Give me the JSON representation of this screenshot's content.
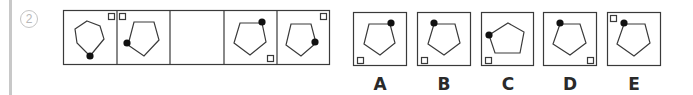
{
  "question": {
    "number": "2"
  },
  "sequence": {
    "cells": [
      {
        "id": "cell-1",
        "pentagon": "point-up",
        "dot_vertex": "bottom",
        "square_corner": "top-right"
      },
      {
        "id": "cell-2",
        "pentagon": "point-up",
        "dot_vertex": "left",
        "square_corner": "top-left"
      },
      {
        "id": "cell-3",
        "pentagon": "none",
        "dot_vertex": "none",
        "square_corner": "none",
        "blank": true
      },
      {
        "id": "cell-4",
        "pentagon": "point-up",
        "dot_vertex": "top-right",
        "square_corner": "bottom-right"
      },
      {
        "id": "cell-5",
        "pentagon": "point-up",
        "dot_vertex": "right",
        "square_corner": "top-right"
      }
    ]
  },
  "options": [
    {
      "label": "A",
      "pentagon": "point-up",
      "dot_vertex": "top-right",
      "square_corner": "bottom-left"
    },
    {
      "label": "B",
      "pentagon": "point-up",
      "dot_vertex": "top-left",
      "square_corner": "bottom-left"
    },
    {
      "label": "C",
      "pentagon": "rotated",
      "dot_vertex": "left",
      "square_corner": "bottom-left"
    },
    {
      "label": "D",
      "pentagon": "point-up",
      "dot_vertex": "top-left",
      "square_corner": "bottom-right"
    },
    {
      "label": "E",
      "pentagon": "point-up",
      "dot_vertex": "top-left",
      "square_corner": "top-left"
    }
  ],
  "colors": {
    "stroke": "#3a3a3a",
    "dot": "#111111",
    "margin_line": "#c8c8c8",
    "question_number": "#b8b8b8"
  }
}
